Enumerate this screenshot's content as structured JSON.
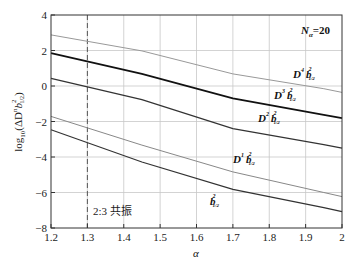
{
  "chart_data": {
    "type": "line",
    "title": "",
    "xlabel": "α",
    "ylabel": "log10(ΔD^n b_{1/2}^2)",
    "xlim": [
      1.2,
      2.0
    ],
    "ylim": [
      -8,
      4
    ],
    "xticks": [
      "1.2",
      "1.3",
      "1.4",
      "1.5",
      "1.6",
      "1.7",
      "1.8",
      "1.9",
      "2"
    ],
    "yticks": [
      "4",
      "2",
      "0",
      "−2",
      "−4",
      "−6",
      "−8"
    ],
    "grid": true,
    "annotations": [
      {
        "text": "N_α=20",
        "x": 1.88,
        "y": 3.0
      },
      {
        "text": "2:3 共振",
        "x": 1.32,
        "y": -7.0
      },
      {
        "type": "vline",
        "x": 1.3,
        "style": "dashed"
      }
    ],
    "x": [
      1.2,
      1.45,
      1.7,
      1.95,
      2.0
    ],
    "series": [
      {
        "name": "D^4 b_{1/2}^2",
        "color": "#999999",
        "values": [
          2.88,
          1.98,
          0.68,
          -0.15,
          -0.36
        ]
      },
      {
        "name": "D^3 b_{1/2}^2",
        "color": "#111111",
        "values": [
          1.85,
          0.68,
          -0.7,
          -1.62,
          -1.81
        ]
      },
      {
        "name": "D^2 b_{1/2}^2",
        "color": "#333333",
        "values": [
          0.43,
          -0.77,
          -2.4,
          -3.3,
          -3.5
        ]
      },
      {
        "name": "D^1 b_{1/2}^2",
        "color": "#888888",
        "values": [
          -1.71,
          -3.33,
          -4.84,
          -6.0,
          -6.23
        ]
      },
      {
        "name": "b_{1/2}^2",
        "color": "#333333",
        "values": [
          -2.47,
          -4.28,
          -5.82,
          -6.85,
          -7.08
        ]
      }
    ]
  },
  "labels": {
    "n_alpha": "N",
    "n_alpha_sub": "α",
    "n_alpha_val": "=20",
    "resonance": "2:3 共振",
    "xlabel": "α",
    "ylabel_log": "log",
    "ylabel_sub": "10",
    "ylabel_rest": "(ΔD",
    "ylabel_n": "n",
    "ylabel_b": "b",
    "ylabel_b_sup": "2",
    "ylabel_b_sub": "1/2",
    "ylabel_close": ")",
    "d": "D",
    "b": "b",
    "sq": "2",
    "half": "1/2",
    "p4": "4",
    "p3": "3",
    "p2": "2",
    "p1": "1"
  }
}
